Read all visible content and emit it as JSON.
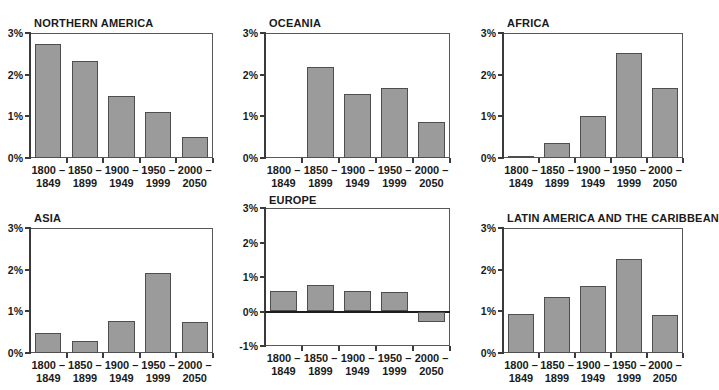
{
  "figure": {
    "value_unit": "%",
    "bar_fill_color": "#9b9b9b",
    "bar_border_color": "#4e4e50",
    "axis_color": "#3a3a3c",
    "categories": [
      "1800 –|1849",
      "1850 –|1899",
      "1900 –|1949",
      "1950 –|1999",
      "2000 –|2050"
    ],
    "category_lines": [
      [
        "1800 –",
        "1849"
      ],
      [
        "1850 –",
        "1899"
      ],
      [
        "1900 –",
        "1949"
      ],
      [
        "1950 –",
        "1999"
      ],
      [
        "2000 –",
        "2050"
      ]
    ]
  },
  "chart_data": [
    {
      "type": "bar",
      "title": "NORTHERN AMERICA",
      "categories": [
        "1800 – 1849",
        "1850 – 1899",
        "1900 – 1949",
        "1950 – 1999",
        "2000 – 2050"
      ],
      "values": [
        2.74,
        2.33,
        1.48,
        1.1,
        0.5
      ],
      "xlabel": "",
      "ylabel": "",
      "ylim": [
        0,
        3
      ],
      "yticks": [
        0,
        1,
        2,
        3
      ],
      "ytick_labels": [
        "0%",
        "1%",
        "2%",
        "3%"
      ],
      "grid": false,
      "legend": "none"
    },
    {
      "type": "bar",
      "title": "OCEANIA",
      "categories": [
        "1800 – 1849",
        "1850 – 1899",
        "1900 – 1949",
        "1950 – 1999",
        "2000 – 2050"
      ],
      "values": [
        0.0,
        2.19,
        1.53,
        1.67,
        0.86
      ],
      "xlabel": "",
      "ylabel": "",
      "ylim": [
        0,
        3
      ],
      "yticks": [
        0,
        1,
        2,
        3
      ],
      "ytick_labels": [
        "0%",
        "1%",
        "2%",
        "3%"
      ],
      "grid": false,
      "legend": "none"
    },
    {
      "type": "bar",
      "title": "AFRICA",
      "categories": [
        "1800 – 1849",
        "1850 – 1899",
        "1900 – 1949",
        "1950 – 1999",
        "2000 – 2050"
      ],
      "values": [
        0.06,
        0.35,
        1.02,
        2.52,
        1.68
      ],
      "xlabel": "",
      "ylabel": "",
      "ylim": [
        0,
        3
      ],
      "yticks": [
        0,
        1,
        2,
        3
      ],
      "ytick_labels": [
        "0%",
        "1%",
        "2%",
        "3%"
      ],
      "grid": false,
      "legend": "none"
    },
    {
      "type": "bar",
      "title": "ASIA",
      "categories": [
        "1800 – 1849",
        "1850 – 1899",
        "1900 – 1949",
        "1950 – 1999",
        "2000 – 2050"
      ],
      "values": [
        0.48,
        0.3,
        0.78,
        1.93,
        0.74
      ],
      "xlabel": "",
      "ylabel": "",
      "ylim": [
        0,
        3
      ],
      "yticks": [
        0,
        1,
        2,
        3
      ],
      "ytick_labels": [
        "0%",
        "1%",
        "2%",
        "3%"
      ],
      "grid": false,
      "legend": "none"
    },
    {
      "type": "bar",
      "title": "EUROPE",
      "categories": [
        "1800 – 1849",
        "1850 – 1899",
        "1900 – 1949",
        "1950 – 1999",
        "2000 – 2050"
      ],
      "values": [
        0.6,
        0.78,
        0.58,
        0.57,
        -0.3
      ],
      "xlabel": "",
      "ylabel": "",
      "ylim": [
        -1,
        3
      ],
      "yticks": [
        -1,
        0,
        1,
        2,
        3
      ],
      "ytick_labels": [
        "-1%",
        "0%",
        "1%",
        "2%",
        "3%"
      ],
      "grid": false,
      "legend": "none"
    },
    {
      "type": "bar",
      "title": "LATIN AMERICA AND THE CARIBBEAN",
      "categories": [
        "1800 – 1849",
        "1850 – 1899",
        "1900 – 1949",
        "1950 – 1999",
        "2000 – 2050"
      ],
      "values": [
        0.93,
        1.35,
        1.62,
        2.25,
        0.92
      ],
      "xlabel": "",
      "ylabel": "",
      "ylim": [
        0,
        3
      ],
      "yticks": [
        0,
        1,
        2,
        3
      ],
      "ytick_labels": [
        "0%",
        "1%",
        "2%",
        "3%"
      ],
      "grid": false,
      "legend": "none"
    }
  ]
}
